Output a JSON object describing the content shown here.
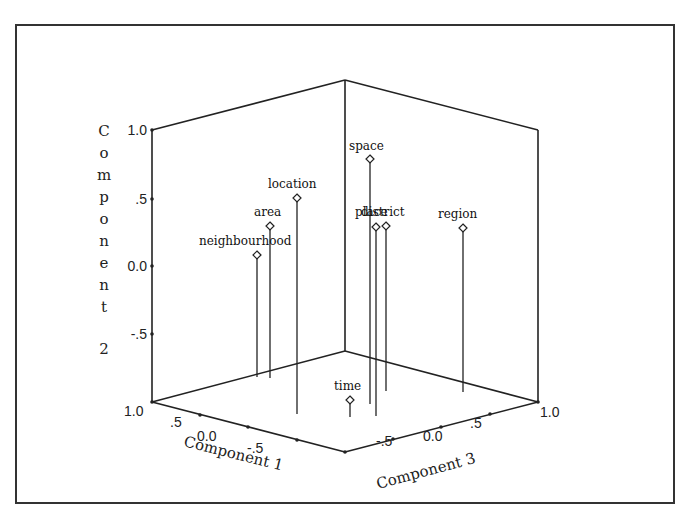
{
  "chart_data": {
    "type": "scatter3d",
    "title": "",
    "axes": {
      "x": {
        "label": "Component 1",
        "ticks": [
          "1.0",
          ".5",
          "0.0",
          "-.5"
        ],
        "range": [
          -1.0,
          1.0
        ]
      },
      "y": {
        "label": "Component 2",
        "ticks": [
          "1.0",
          ".5",
          "0.0",
          "-.5"
        ],
        "range": [
          -1.0,
          1.0
        ]
      },
      "z": {
        "label": "Component 3",
        "ticks": [
          "-.5",
          "0.0",
          ".5",
          "1.0"
        ],
        "range": [
          -1.0,
          1.0
        ]
      }
    },
    "points": [
      {
        "label": "neighbourhood",
        "screen": [
          257,
          255
        ],
        "stem_bottom": 377,
        "label_pos": [
          199,
          245
        ]
      },
      {
        "label": "area",
        "screen": [
          270,
          226
        ],
        "stem_bottom": 378,
        "label_pos": [
          254,
          216
        ]
      },
      {
        "label": "location",
        "screen": [
          297,
          198
        ],
        "stem_bottom": 414,
        "label_pos": [
          268,
          188
        ]
      },
      {
        "label": "space",
        "screen": [
          370,
          159
        ],
        "stem_bottom": 404,
        "label_pos": [
          349,
          150
        ]
      },
      {
        "label": "place",
        "screen": [
          376,
          227
        ],
        "stem_bottom": 416,
        "label_pos": [
          355,
          216
        ]
      },
      {
        "label": "district",
        "screen": [
          386,
          226
        ],
        "stem_bottom": 391,
        "label_pos": [
          361,
          216
        ]
      },
      {
        "label": "region",
        "screen": [
          463,
          228
        ],
        "stem_bottom": 392,
        "label_pos": [
          438,
          218
        ]
      },
      {
        "label": "time",
        "screen": [
          350,
          400
        ],
        "stem_bottom": 417,
        "label_pos": [
          334,
          390
        ]
      }
    ],
    "grid": false,
    "legend": null
  },
  "labels": {
    "y_axis_title_chars": [
      "C",
      "o",
      "m",
      "p",
      "o",
      "n",
      "e",
      "n",
      "t",
      "2"
    ],
    "x_axis_title": "Component 1",
    "z_axis_title": "Component 3"
  }
}
